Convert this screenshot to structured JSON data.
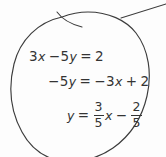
{
  "canvas": {
    "width": 166,
    "height": 157,
    "background_color": "#fdfdfd",
    "ink_color": "#343434",
    "description": "handwritten-algebra-note"
  },
  "annotation": {
    "shape_name": "hand-drawn-oval-circle",
    "leader_line_name": "pointer-line-to-upper-right",
    "stroke_color": "#3c3c3c",
    "stroke_width": 1.1
  },
  "work": {
    "title": "solve-for-y",
    "lines": [
      {
        "id": "line-1",
        "text": "3x − 5y = 2",
        "parts": {
          "lhs_coeff_x": "3",
          "x": "x",
          "minus": "−",
          "lhs_coeff_y": "5",
          "y": "y",
          "equals": "=",
          "rhs": "2"
        }
      },
      {
        "id": "line-2",
        "text": "−5y = −3x + 2",
        "parts": {
          "neg": "−",
          "coeff_y": "5",
          "y": "y",
          "equals": "=",
          "neg2": "−",
          "coeff_x": "3",
          "x": "x",
          "plus": "+",
          "constant": "2"
        }
      },
      {
        "id": "line-3",
        "text": "y = 3/5 x − 2/5",
        "parts": {
          "y": "y",
          "equals": "=",
          "slope_num": "3",
          "slope_den": "5",
          "x": "x",
          "minus": "−",
          "intercept_num": "2",
          "intercept_den": "5"
        }
      }
    ]
  }
}
